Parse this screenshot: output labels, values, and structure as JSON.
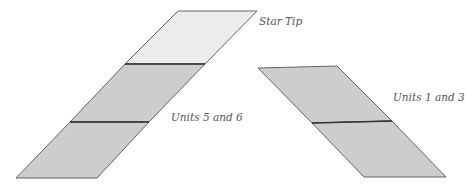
{
  "diagram": {
    "labels": {
      "star_tip": "Star Tip",
      "units_5_6": "Units 5 and 6",
      "units_1_3": "Units 1 and 3"
    },
    "colors": {
      "tip_fill": "#ececec",
      "unit_fill": "#cdcdcd",
      "outline": "#555555",
      "seam": "#333333",
      "label": "#555555"
    },
    "left_strip": {
      "pieces": [
        "Star Tip",
        "Unit",
        "Unit"
      ],
      "group_label": "Units 5 and 6"
    },
    "right_strip": {
      "pieces": [
        "Unit",
        "Unit"
      ],
      "group_label": "Units 1 and 3"
    }
  }
}
